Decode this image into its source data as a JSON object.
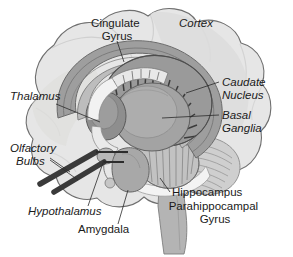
{
  "figure": {
    "background_color": "#ffffff",
    "outline_color": "#6f6f6f",
    "palette": {
      "brain_fill": "#e3e3e3",
      "brain_shade": "#d2d2d2",
      "cortex_light": "#dcdcdc",
      "mid_grey": "#a9a9a9",
      "dark_grey": "#7b7b7b",
      "darker_grey": "#5c5c5c",
      "near_black": "#3a3a3a",
      "highlight_white": "#f7f7f7",
      "label_color": "#1a1a1a",
      "leader_color": "#2b2b2b"
    }
  },
  "labels": [
    {
      "id": "cingulate-gyrus",
      "lines": [
        "Cingulate",
        "Gyrus"
      ],
      "style": "regular",
      "anchor": "middle",
      "x": 117,
      "y": 27,
      "line_height": 13,
      "font_size": 11.5
    },
    {
      "id": "cortex",
      "lines": [
        "Cortex"
      ],
      "style": "italic",
      "anchor": "middle",
      "x": 196,
      "y": 27,
      "line_height": 13,
      "font_size": 11.5
    },
    {
      "id": "caudate-nucleus",
      "lines": [
        "Caudate",
        "Nucleus"
      ],
      "style": "italic",
      "anchor": "start",
      "x": 222,
      "y": 86,
      "line_height": 13,
      "font_size": 11.5
    },
    {
      "id": "basal-ganglia",
      "lines": [
        "Basal",
        "Ganglia"
      ],
      "style": "italic",
      "anchor": "start",
      "x": 222,
      "y": 119,
      "line_height": 13,
      "font_size": 11.5
    },
    {
      "id": "thalamus",
      "lines": [
        "Thalamus"
      ],
      "style": "italic",
      "anchor": "start",
      "x": 10,
      "y": 100,
      "line_height": 13,
      "font_size": 11.5
    },
    {
      "id": "olfactory-bulbs",
      "lines": [
        "Olfactory",
        "Bulbs"
      ],
      "style": "italic",
      "anchor": "start",
      "x": 10,
      "y": 152,
      "line_height": 13,
      "font_size": 11.5
    },
    {
      "id": "hypothalamus",
      "lines": [
        "Hypothalamus"
      ],
      "style": "italic",
      "anchor": "start",
      "x": 28,
      "y": 215,
      "line_height": 13,
      "font_size": 11.5
    },
    {
      "id": "amygdala",
      "lines": [
        "Amygdala"
      ],
      "style": "regular",
      "anchor": "start",
      "x": 78,
      "y": 233,
      "line_height": 13,
      "font_size": 11.5
    },
    {
      "id": "hippocampus",
      "lines": [
        "Hippocampus"
      ],
      "style": "regular",
      "anchor": "start",
      "x": 172,
      "y": 196,
      "line_height": 13,
      "font_size": 11.5
    },
    {
      "id": "parahippocampal-gyrus",
      "lines": [
        "Parahippocampal",
        "Gyrus"
      ],
      "style": "regular",
      "anchor": "middle",
      "x": 215,
      "y": 210,
      "line_height": 13,
      "font_size": 11.5
    }
  ],
  "structures": [
    {
      "id": "cerebral-cortex",
      "name": "Cortex"
    },
    {
      "id": "cingulate-gyrus",
      "name": "Cingulate Gyrus"
    },
    {
      "id": "caudate-nucleus",
      "name": "Caudate Nucleus"
    },
    {
      "id": "basal-ganglia",
      "name": "Basal Ganglia"
    },
    {
      "id": "thalamus",
      "name": "Thalamus"
    },
    {
      "id": "olfactory-bulbs",
      "name": "Olfactory Bulbs"
    },
    {
      "id": "hypothalamus",
      "name": "Hypothalamus"
    },
    {
      "id": "amygdala",
      "name": "Amygdala"
    },
    {
      "id": "hippocampus",
      "name": "Hippocampus"
    },
    {
      "id": "parahippocampal-gyrus",
      "name": "Parahippocampal Gyrus"
    },
    {
      "id": "brainstem",
      "name": "Brainstem"
    },
    {
      "id": "cerebellum",
      "name": "Cerebellum"
    }
  ]
}
